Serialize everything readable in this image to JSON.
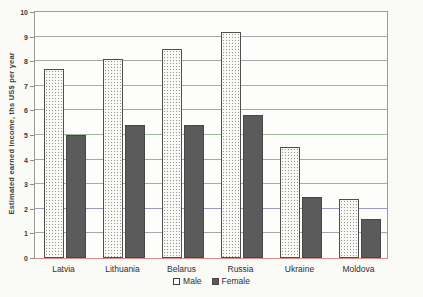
{
  "chart_data": {
    "type": "bar",
    "title": "",
    "ylabel": "Estimated earned income, ths US$ per year",
    "xlabel": "",
    "ylim": [
      0,
      10
    ],
    "yticks": [
      0,
      1,
      2,
      3,
      4,
      5,
      6,
      7,
      8,
      9,
      10
    ],
    "grid": true,
    "legend_position": "bottom-center",
    "categories": [
      "Latvia",
      "Lithuania",
      "Belarus",
      "Russia",
      "Ukraine",
      "Moldova"
    ],
    "series": [
      {
        "name": "Male",
        "values": [
          7.7,
          8.1,
          8.5,
          9.2,
          4.5,
          2.4
        ],
        "fill": "white-stipple-pattern"
      },
      {
        "name": "Female",
        "values": [
          5.0,
          5.4,
          5.4,
          5.8,
          2.5,
          1.6
        ],
        "fill": "dark-gray-solid"
      }
    ],
    "colors": {
      "male_bar": "#f9f9f6",
      "male_dot": "#828282",
      "female_bar": "#5b5b5b",
      "grid_default": "#a6a6a6",
      "grid_tints": {
        "2": "#9a9ac6",
        "3": "#a9b089",
        "5": "#a0bd9a",
        "7": "#a9b0a0"
      },
      "baseline": "#d88d86",
      "axis": "#8a8a8a",
      "text": "#3a3a3a",
      "page_bg": "#fafaf7",
      "plot_bg": "#fdfdfc"
    }
  }
}
